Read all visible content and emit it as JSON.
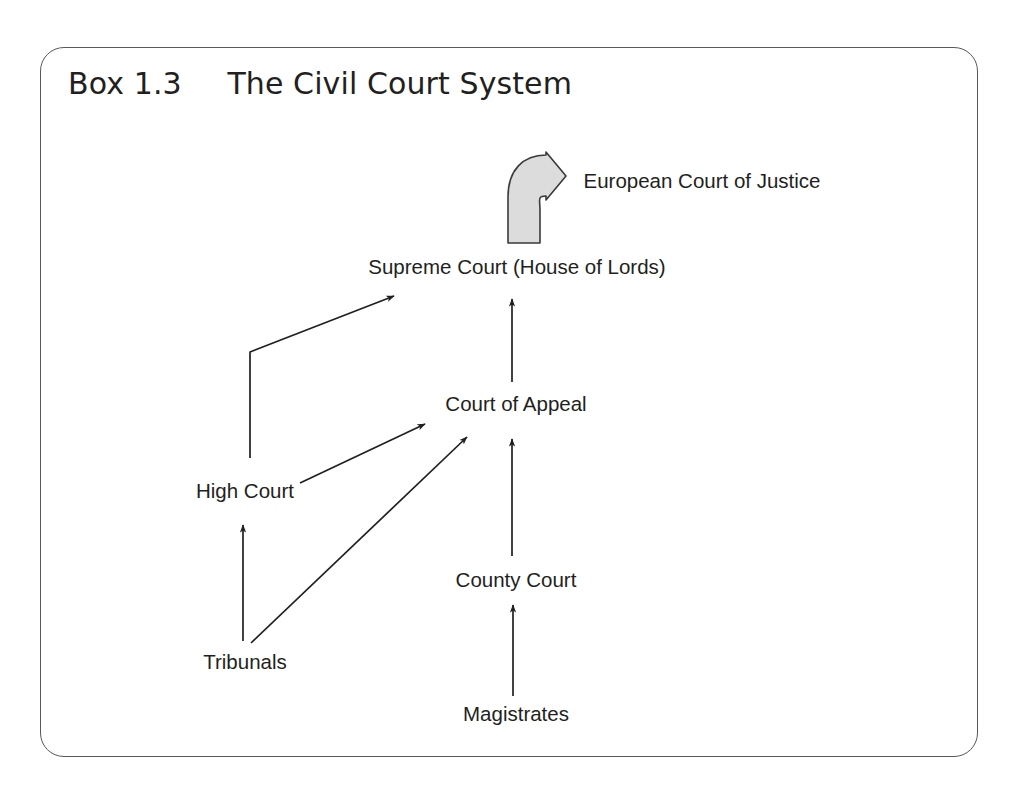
{
  "box": {
    "heading_label": "Box",
    "heading_number": "1.3",
    "heading_title": "The Civil Court System",
    "border_color": "#58585a",
    "background_color": "#ffffff"
  },
  "diagram": {
    "type": "hierarchy-flow",
    "ink_color": "#231f20",
    "ecj_arrow_fill": "#dcdcdc",
    "ecj_arrow_stroke": "#3a3a3c",
    "nodes": [
      {
        "id": "european-court-of-justice",
        "label": "European Court of Justice",
        "x": 702,
        "y": 181,
        "anchor": "middle"
      },
      {
        "id": "supreme-court",
        "label": "Supreme Court (House of Lords)",
        "x": 517,
        "y": 273,
        "anchor": "middle"
      },
      {
        "id": "court-of-appeal",
        "label": "Court of Appeal",
        "x": 516,
        "y": 410,
        "anchor": "middle"
      },
      {
        "id": "high-court",
        "label": "High Court",
        "x": 245,
        "y": 497,
        "anchor": "middle"
      },
      {
        "id": "county-court",
        "label": "County Court",
        "x": 516,
        "y": 586,
        "anchor": "middle"
      },
      {
        "id": "tribunals",
        "label": "Tribunals",
        "x": 245,
        "y": 668,
        "anchor": "middle"
      },
      {
        "id": "magistrates",
        "label": "Magistrates",
        "x": 516,
        "y": 720,
        "anchor": "middle"
      }
    ],
    "edges": [
      {
        "id": "supreme-to-ecj",
        "from": "supreme-court",
        "to": "european-court-of-justice",
        "style": "block-curved-arrow"
      },
      {
        "id": "high-court-to-supreme-court",
        "from": "high-court",
        "to": "supreme-court",
        "style": "elbow-arrow"
      },
      {
        "id": "court-of-appeal-to-supreme-court",
        "from": "court-of-appeal",
        "to": "supreme-court",
        "style": "straight-arrow"
      },
      {
        "id": "high-court-to-court-of-appeal",
        "from": "high-court",
        "to": "court-of-appeal",
        "style": "straight-arrow"
      },
      {
        "id": "tribunals-to-court-of-appeal",
        "from": "tribunals",
        "to": "court-of-appeal",
        "style": "straight-arrow"
      },
      {
        "id": "county-court-to-court-of-appeal",
        "from": "county-court",
        "to": "court-of-appeal",
        "style": "straight-arrow"
      },
      {
        "id": "tribunals-to-high-court",
        "from": "tribunals",
        "to": "high-court",
        "style": "straight-arrow"
      },
      {
        "id": "magistrates-to-county-court",
        "from": "magistrates",
        "to": "county-court",
        "style": "straight-arrow"
      }
    ]
  }
}
